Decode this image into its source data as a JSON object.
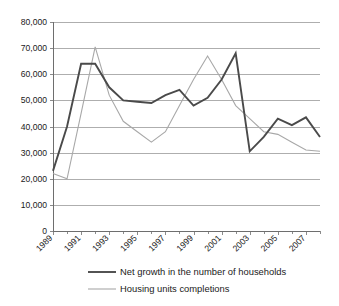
{
  "chart_data": {
    "type": "line",
    "title": "",
    "subtitle": "",
    "xlabel": "",
    "ylabel": "",
    "grid": true,
    "legend_position": "bottom",
    "xlim": [
      1989,
      2008
    ],
    "ylim": [
      0,
      80000
    ],
    "x": [
      1989,
      1990,
      1991,
      1992,
      1993,
      1994,
      1995,
      1996,
      1997,
      1998,
      1999,
      2000,
      2001,
      2002,
      2003,
      2004,
      2005,
      2006,
      2007,
      2008
    ],
    "xtick_labels": [
      "1989",
      "1991",
      "1993",
      "1995",
      "1997",
      "1999",
      "2001",
      "2003",
      "2005",
      "2007"
    ],
    "xtick_values": [
      1989,
      1991,
      1993,
      1995,
      1997,
      1999,
      2001,
      2003,
      2005,
      2007
    ],
    "ytick_labels": [
      "0",
      "10,000",
      "20,000",
      "30,000",
      "40,000",
      "50,000",
      "60,000",
      "70,000",
      "80,000"
    ],
    "ytick_values": [
      0,
      10000,
      20000,
      30000,
      40000,
      50000,
      60000,
      70000,
      80000
    ],
    "series": [
      {
        "name": "Net growth in the number of households",
        "color": "#4a4a4a",
        "width": 1.9,
        "values": [
          23000,
          40000,
          64000,
          64000,
          55000,
          50000,
          49500,
          49000,
          52000,
          54000,
          48000,
          51000,
          58000,
          68000,
          30500,
          36000,
          43000,
          40500,
          43500,
          36000
        ]
      },
      {
        "name": "Housing units completions",
        "color": "#a8a8a8",
        "width": 1.1,
        "values": [
          22000,
          20000,
          45000,
          70500,
          52000,
          42000,
          38000,
          34000,
          38000,
          48000,
          58000,
          67000,
          58000,
          48000,
          43000,
          38000,
          37000,
          34000,
          31000,
          30500
        ]
      }
    ]
  },
  "legend": {
    "items": [
      {
        "label": "Net growth in the number of households",
        "color": "#4a4a4a"
      },
      {
        "label": "Housing units completions",
        "color": "#a8a8a8"
      }
    ]
  }
}
